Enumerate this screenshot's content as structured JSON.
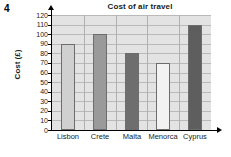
{
  "question_number": "4",
  "chart_data": {
    "type": "bar",
    "title": "Cost of air travel",
    "xlabel": "Resort",
    "ylabel": "Cost (£)",
    "categories": [
      "Lisbon",
      "Crete",
      "Malta",
      "Menorca",
      "Cyprus"
    ],
    "values": [
      90,
      100,
      80,
      70,
      110
    ],
    "bar_colors": [
      "#d0d0d0",
      "#9a9a9a",
      "#6e6e6e",
      "#f2f2f2",
      "#5e5e5e"
    ],
    "ylim": [
      0,
      120
    ],
    "ytick_step": 10,
    "yticks": [
      0,
      10,
      20,
      30,
      40,
      50,
      60,
      70,
      80,
      90,
      100,
      110,
      120
    ],
    "ytick_labels": [
      "0",
      "10",
      "20",
      "30",
      "40",
      "50",
      "60",
      "70",
      "80",
      "90",
      "100",
      "110",
      "120"
    ],
    "grid": true,
    "legend": false,
    "plot_background": "#e3e3e3",
    "gridline_color": "#b9b9b9"
  }
}
